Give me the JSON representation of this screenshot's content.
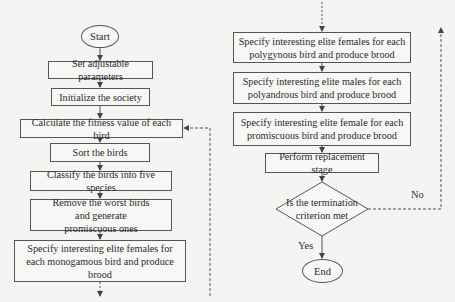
{
  "flowchart": {
    "start": "Start",
    "end": "End",
    "left_steps": [
      "Set adjustable parameters",
      "Initialize the society",
      "Calculate the fitness value of each bird",
      "Sort the birds",
      "Classify the birds into five species",
      "Remove the worst birds and generate promiscuous ones",
      "Specify interesting elite females for each monogamous bird and produce brood"
    ],
    "right_steps": [
      "Specify interesting elite females for each polygynous bird and produce brood",
      "Specify interesting elite males for each polyandrous bird and produce brood",
      "Specify interesting elite female for each promiscuous bird and produce brood",
      "Perform replacement stage"
    ],
    "decision": "Is the termination criterion met",
    "yes_label": "Yes",
    "no_label": "No"
  },
  "colors": {
    "line": "#555555",
    "background": "#f4f4f2"
  }
}
